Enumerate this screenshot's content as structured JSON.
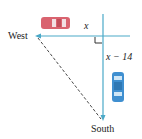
{
  "diagram": {
    "labels": {
      "west": "West",
      "south": "South",
      "x": "x",
      "x_minus_14": "x − 14"
    },
    "colors": {
      "road_line": "#4aa9c8",
      "dashed_line": "#333333",
      "red_car": "#d9636f",
      "blue_car": "#3f8fd0",
      "text": "#222222"
    },
    "elements": [
      {
        "type": "red-car",
        "direction": "west"
      },
      {
        "type": "blue-car",
        "direction": "south"
      },
      {
        "type": "right-angle-marker"
      },
      {
        "type": "dashed-hypotenuse",
        "from": "West",
        "to": "South"
      }
    ]
  }
}
